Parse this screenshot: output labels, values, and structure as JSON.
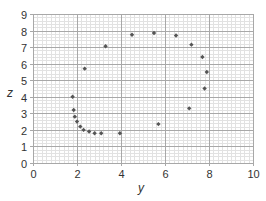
{
  "chart_data": {
    "type": "scatter",
    "title": "",
    "xlabel": "y",
    "ylabel": "z",
    "xlim": [
      0,
      10
    ],
    "ylim": [
      0,
      9
    ],
    "xticks": [
      0,
      2,
      4,
      6,
      8,
      10
    ],
    "yticks": [
      0,
      1,
      2,
      3,
      4,
      5,
      6,
      7,
      8,
      9
    ],
    "grid": {
      "major": true,
      "minor": true,
      "minor_x_step": 0.2,
      "minor_y_step": 0.2
    },
    "legend": null,
    "series": [
      {
        "name": "points",
        "color": "#555555",
        "marker": "diamond",
        "points": [
          [
            1.8,
            4.0
          ],
          [
            1.85,
            3.2
          ],
          [
            1.9,
            2.8
          ],
          [
            2.0,
            2.5
          ],
          [
            2.15,
            2.2
          ],
          [
            2.3,
            2.0
          ],
          [
            2.55,
            1.9
          ],
          [
            2.8,
            1.8
          ],
          [
            3.1,
            1.8
          ],
          [
            3.95,
            1.8
          ],
          [
            2.35,
            5.7
          ],
          [
            3.3,
            7.05
          ],
          [
            4.5,
            7.75
          ],
          [
            5.5,
            7.85
          ],
          [
            6.5,
            7.7
          ],
          [
            7.2,
            7.15
          ],
          [
            7.7,
            6.4
          ],
          [
            7.9,
            5.5
          ],
          [
            7.8,
            4.5
          ],
          [
            7.1,
            3.3
          ],
          [
            5.7,
            2.35
          ]
        ]
      }
    ]
  },
  "colors": {
    "major_grid": "#a8a8a8",
    "minor_grid": "#e2e2e2",
    "marker": "#555555",
    "text": "#333333"
  }
}
